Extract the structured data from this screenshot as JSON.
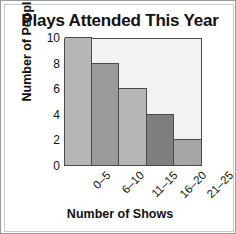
{
  "chart_data": {
    "type": "bar",
    "title": "Plays Attended This Year",
    "xlabel": "Number of Shows",
    "ylabel": "Number of People",
    "categories": [
      "0–5",
      "6–10",
      "11–15",
      "16–20",
      "21–25"
    ],
    "values": [
      10,
      8,
      6,
      4,
      2
    ],
    "ylim": [
      0,
      10
    ],
    "yticks": [
      0,
      2,
      4,
      6,
      8,
      10
    ],
    "ytick_labels": [
      "0",
      "2",
      "4",
      "6",
      "8",
      "10"
    ],
    "grid": false,
    "legend": null,
    "bar_colors": [
      "#b6b6b6",
      "#9a9a9a",
      "#b6b6b6",
      "#7e7e7e",
      "#a6a6a6"
    ],
    "plot_background": "#f2f2f2",
    "axis_color": "#4a4a4a",
    "text_color": "#111111",
    "frame_color": "#9b9b9b"
  }
}
